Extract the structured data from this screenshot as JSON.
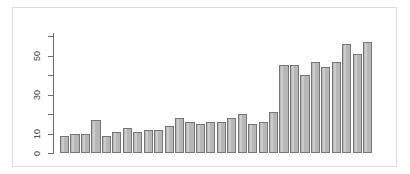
{
  "figure": {
    "background_color": "#ffffff",
    "frame_color": "#dcdcdc",
    "bar_fill_color": "#b7b7b7",
    "bar_border_color": "#767676",
    "axis_color": "#6e6e6e"
  },
  "axis": {
    "y_tick_labels": [
      "0",
      "10",
      "30",
      "50"
    ],
    "y_tick_values": [
      0,
      10,
      30,
      50
    ],
    "y_minor_tick_values": [
      20,
      40,
      60
    ]
  },
  "chart_data": {
    "type": "bar",
    "title": "",
    "xlabel": "",
    "ylabel": "",
    "ylim": [
      0,
      62
    ],
    "grid": false,
    "legend": false,
    "categories": [
      "1",
      "2",
      "3",
      "4",
      "5",
      "6",
      "7",
      "8",
      "9",
      "10",
      "11",
      "12",
      "13",
      "14",
      "15",
      "16",
      "17",
      "18",
      "19",
      "20",
      "21",
      "22",
      "23",
      "24",
      "25",
      "26",
      "27",
      "28",
      "29",
      "30"
    ],
    "values": [
      9,
      10,
      10,
      17,
      9,
      11,
      13,
      11,
      12,
      12,
      14,
      18,
      16,
      15,
      16,
      16,
      18,
      20,
      15,
      16,
      21,
      45,
      45,
      40,
      47,
      44,
      47,
      56,
      51,
      57
    ],
    "tick_labels_shown": [
      "0",
      "10",
      "30",
      "50"
    ]
  }
}
